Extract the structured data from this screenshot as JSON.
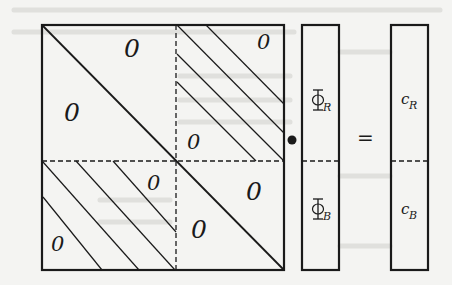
{
  "diagram": {
    "type": "block-matrix-equation",
    "operator_product": "•",
    "operator_equals": "=",
    "matrix": {
      "blocks": [
        {
          "position": "top-left",
          "pattern": "lower-triangular",
          "zeros": [
            "0",
            "0"
          ]
        },
        {
          "position": "top-right",
          "pattern": "banded",
          "zeros": [
            "0",
            "0"
          ]
        },
        {
          "position": "bottom-left",
          "pattern": "banded",
          "zeros": [
            "0",
            "0"
          ]
        },
        {
          "position": "bottom-right",
          "pattern": "lower-triangular",
          "zeros": [
            "0",
            "0"
          ]
        }
      ],
      "zero_label": "0"
    },
    "unknown_vector": {
      "top": {
        "symbol": "Φ",
        "subscript": "R"
      },
      "bottom": {
        "symbol": "Φ",
        "subscript": "B"
      }
    },
    "rhs_vector": {
      "top": {
        "symbol": "c",
        "subscript": "R"
      },
      "bottom": {
        "symbol": "c",
        "subscript": "B"
      }
    },
    "colors": {
      "ink": "#1a1a1a",
      "paper": "#f4f4f2",
      "bleed_through": "#d6d6d2"
    }
  }
}
